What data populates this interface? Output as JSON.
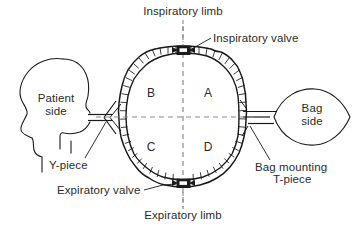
{
  "diagram": {
    "colors": {
      "ink": "#1a1a1a",
      "text": "#2b2b2b",
      "dash": "#8a8a8a",
      "background": "#ffffff"
    },
    "labels": {
      "inspiratory_limb": "Inspiratory limb",
      "inspiratory_valve": "Inspiratory valve",
      "expiratory_limb": "Expiratory limb",
      "expiratory_valve": "Expiratory valve",
      "y_piece": "Y-piece",
      "bag_mounting_line1": "Bag mounting",
      "bag_mounting_line2": "T-piece",
      "patient_side_line1": "Patient",
      "patient_side_line2": "side",
      "bag_side_line1": "Bag",
      "bag_side_line2": "side"
    },
    "quadrants": {
      "top_left": "B",
      "top_right": "A",
      "bottom_left": "C",
      "bottom_right": "D"
    },
    "components": {
      "patient_head": "patient-head-profile",
      "reservoir_bag": "reservoir-bag",
      "circuit_loop": "corrugated-circle-circuit",
      "inspiratory_valve_block": "inspiratory-valve",
      "expiratory_valve_block": "expiratory-valve",
      "y_piece_connector": "y-piece-connector",
      "t_piece_connector": "bag-mounting-t-piece",
      "vertical_axis": "vertical-dashed-axis",
      "horizontal_axis": "horizontal-dashed-axis"
    }
  }
}
